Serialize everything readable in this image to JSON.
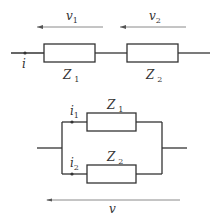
{
  "series_circuit": {
    "voltage_labels": [
      {
        "name": "v",
        "sub": "1"
      },
      {
        "name": "v",
        "sub": "2"
      }
    ],
    "current_label": {
      "name": "i",
      "sub": ""
    },
    "impedances": [
      {
        "name": "Z",
        "sub": "1"
      },
      {
        "name": "Z",
        "sub": "2"
      }
    ]
  },
  "parallel_circuit": {
    "impedances": [
      {
        "name": "Z",
        "sub": "1"
      },
      {
        "name": "Z",
        "sub": "2"
      }
    ],
    "currents": [
      {
        "name": "i",
        "sub": "1"
      },
      {
        "name": "i",
        "sub": "2"
      }
    ],
    "voltage_label": {
      "name": "v",
      "sub": ""
    }
  },
  "colors": {
    "wire": "#333333",
    "arrow": "#8a8a8a",
    "background": "#ffffff"
  }
}
